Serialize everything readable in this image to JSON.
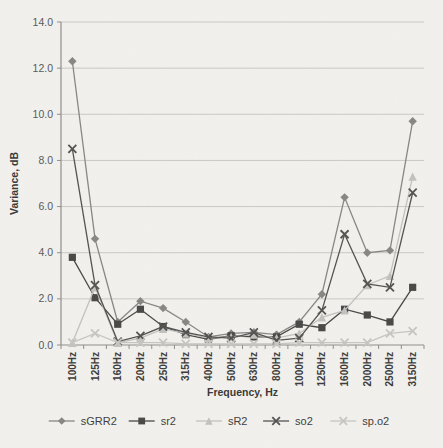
{
  "chart": {
    "title": "",
    "y_axis_title": "Variance, dB",
    "x_axis_title": "Frequency, Hz",
    "legend_labels": [
      "sGRR2",
      "sr2",
      "sR2",
      "so2",
      "sp.o2"
    ]
  },
  "chart_data": {
    "type": "line",
    "title": "",
    "xlabel": "Frequency, Hz",
    "ylabel": "Variance, dB",
    "ylim": [
      0,
      14
    ],
    "yticks": [
      0,
      2,
      4,
      6,
      8,
      10,
      12,
      14
    ],
    "ytick_format_decimals": 1,
    "grid": true,
    "legend_position": "bottom",
    "categories": [
      "100Hz",
      "125Hz",
      "160Hz",
      "200Hz",
      "250Hz",
      "315Hz",
      "400Hz",
      "500Hz",
      "630Hz",
      "800Hz",
      "1000Hz",
      "1250Hz",
      "1600Hz",
      "2000Hz",
      "2500Hz",
      "3150Hz"
    ],
    "series": [
      {
        "name": "sGRR2",
        "marker": "diamond",
        "color": "#878785",
        "values": [
          12.3,
          4.6,
          1.0,
          1.9,
          1.6,
          1.0,
          0.35,
          0.5,
          0.55,
          0.45,
          1.0,
          2.2,
          6.4,
          4.0,
          4.1,
          9.7
        ]
      },
      {
        "name": "sr2",
        "marker": "square",
        "color": "#4a4a48",
        "values": [
          3.8,
          2.05,
          0.9,
          1.55,
          0.8,
          0.45,
          0.25,
          0.4,
          0.35,
          0.35,
          0.9,
          0.75,
          1.55,
          1.3,
          1.0,
          2.5
        ]
      },
      {
        "name": "sR2",
        "marker": "triangle",
        "color": "#c2c1bf",
        "values": [
          0.1,
          2.5,
          0.1,
          0.3,
          0.7,
          0.5,
          0.3,
          0.35,
          0.45,
          0.3,
          0.5,
          1.2,
          1.5,
          2.6,
          3.0,
          7.3
        ]
      },
      {
        "name": "so2",
        "marker": "x",
        "color": "#545452",
        "values": [
          8.5,
          2.6,
          0.15,
          0.4,
          0.8,
          0.55,
          0.35,
          0.3,
          0.55,
          0.2,
          0.3,
          1.5,
          4.8,
          2.65,
          2.5,
          6.6
        ]
      },
      {
        "name": "sp.o2",
        "marker": "x",
        "color": "#c6c5c1",
        "values": [
          0.1,
          0.5,
          0.1,
          0.1,
          0.1,
          0.05,
          0.05,
          0.05,
          0.05,
          0.05,
          0.1,
          0.1,
          0.1,
          0.1,
          0.5,
          0.6
        ]
      }
    ],
    "style": {
      "background": "#f2f1ee",
      "gridline_color": "#c9c8c5",
      "axis_color": "#8f8e8b",
      "ytick_label_color": "#5a5a58",
      "xtick_label_color": "#3d3d3b",
      "axis_title_color": "#3a3a38",
      "legend_text_color": "#3f3f3d"
    }
  }
}
